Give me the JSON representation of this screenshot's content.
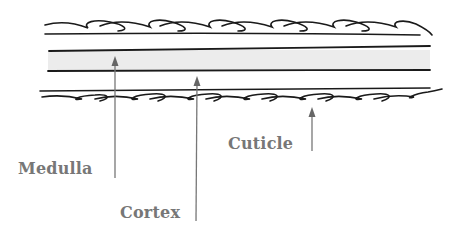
{
  "diagram": {
    "labels": [
      {
        "id": "medulla",
        "text": "Medulla"
      },
      {
        "id": "cortex",
        "text": "Cortex"
      },
      {
        "id": "cuticle",
        "text": "Cuticle"
      }
    ],
    "colors": {
      "outline": "#1a1a1a",
      "medulla_fill": "#ececec",
      "pointer": "#777777",
      "label": "#777777",
      "background": "#ffffff"
    }
  }
}
